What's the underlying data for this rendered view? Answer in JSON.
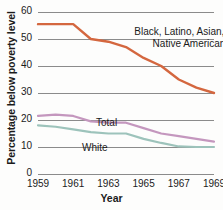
{
  "chart_data": {
    "type": "line",
    "title": "",
    "xlabel": "Year",
    "ylabel": "Percentage below poverty level",
    "xlim": [
      1959,
      1969
    ],
    "ylim": [
      0,
      60
    ],
    "ytick_labels": [
      "0",
      "10",
      "20",
      "30",
      "40",
      "50",
      "60"
    ],
    "ytick_values": [
      0,
      10,
      20,
      30,
      40,
      50,
      60
    ],
    "xtick_labels": [
      "1959",
      "1961",
      "1963",
      "1965",
      "1967",
      "1969"
    ],
    "xtick_values": [
      1959,
      1961,
      1963,
      1965,
      1967,
      1969
    ],
    "grid": true,
    "legend_position": "inline-annotations",
    "x": [
      1959,
      1960,
      1961,
      1962,
      1963,
      1964,
      1965,
      1966,
      1967,
      1968,
      1969
    ],
    "series": [
      {
        "name": "Black, Latino, Asian, and Native American",
        "color": "#d4673f",
        "values": [
          55.5,
          55.5,
          55.5,
          50.0,
          49.0,
          47.0,
          43.0,
          40.0,
          35.0,
          32.0,
          30.0
        ]
      },
      {
        "name": "Total",
        "color": "#c497be",
        "values": [
          21.5,
          22.0,
          21.5,
          19.5,
          19.0,
          19.0,
          17.0,
          15.0,
          14.0,
          13.0,
          12.0
        ]
      },
      {
        "name": "White",
        "color": "#9dc3bb",
        "values": [
          18.0,
          17.5,
          16.5,
          15.5,
          15.0,
          15.0,
          13.0,
          11.5,
          10.2,
          10.0,
          10.0
        ]
      }
    ],
    "annotations": [
      {
        "text_line1": "Black, Latino, Asian, and",
        "text_line2": "Native American"
      },
      {
        "text": "Total"
      },
      {
        "text": "White"
      }
    ]
  },
  "axes": {
    "x_title": "Year",
    "y_title": "Percentage below poverty level"
  },
  "labels": {
    "minority_line1": "Black, Latino, Asian, and",
    "minority_line2": "Native American",
    "total": "Total",
    "white": "White"
  },
  "colors": {
    "minority": "#d4673f",
    "total": "#c497be",
    "white": "#9dc3bb",
    "gridline": "#8b8b8b",
    "text": "#1b1b1b",
    "background": "#fdfdfc"
  }
}
